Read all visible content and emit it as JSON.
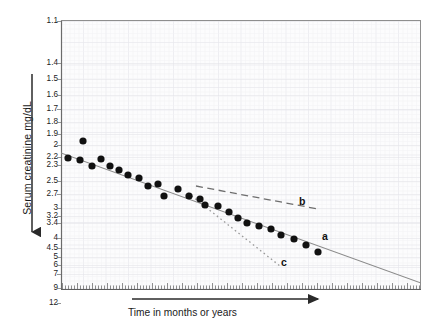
{
  "chart_data": {
    "type": "scatter",
    "title": "",
    "subtitle": "",
    "xlabel": "Time in months or years",
    "ylabel": "Serum creatinine mg/dL",
    "yscale": "reciprocal-log (inverted, 1/creatinine)",
    "y_tick_labels": [
      "1.1",
      "1.4",
      "1.5",
      "1.6",
      "1.7",
      "1.8",
      "1.9",
      "2",
      "2.2",
      "2.3",
      "2.5",
      "2.7",
      "3",
      "3.2",
      "3.4",
      "4",
      "4.5",
      "5",
      "6",
      "7",
      "9",
      "12"
    ],
    "y_tick_pixels": [
      21,
      63,
      79,
      95,
      109,
      122,
      134,
      145,
      157,
      165,
      181,
      194,
      208,
      216,
      223,
      238,
      248,
      257,
      265,
      274,
      288,
      303
    ],
    "ylim_labels": [
      "1.1",
      "12"
    ],
    "x_tick_style": "fine unlabeled graduations",
    "grid": true,
    "grid_style": "faint semi-log graph paper",
    "legend_position": "inline annotations",
    "points": [
      {
        "x": 68,
        "y": 158
      },
      {
        "x": 80,
        "y": 160
      },
      {
        "x": 83,
        "y": 141
      },
      {
        "x": 92,
        "y": 166
      },
      {
        "x": 101,
        "y": 159
      },
      {
        "x": 110,
        "y": 166
      },
      {
        "x": 119,
        "y": 170
      },
      {
        "x": 128,
        "y": 175
      },
      {
        "x": 139,
        "y": 178
      },
      {
        "x": 148,
        "y": 186
      },
      {
        "x": 158,
        "y": 184
      },
      {
        "x": 164,
        "y": 196
      },
      {
        "x": 178,
        "y": 189
      },
      {
        "x": 189,
        "y": 196
      },
      {
        "x": 200,
        "y": 199
      },
      {
        "x": 205,
        "y": 205
      },
      {
        "x": 218,
        "y": 206
      },
      {
        "x": 229,
        "y": 212
      },
      {
        "x": 238,
        "y": 218
      },
      {
        "x": 247,
        "y": 223
      },
      {
        "x": 259,
        "y": 226
      },
      {
        "x": 271,
        "y": 229
      },
      {
        "x": 281,
        "y": 235
      },
      {
        "x": 294,
        "y": 239
      },
      {
        "x": 306,
        "y": 245
      },
      {
        "x": 318,
        "y": 252
      }
    ],
    "series": [
      {
        "name": "a",
        "label": "a",
        "style": "solid",
        "description": "observed decline of 1/creatinine over time",
        "x1": 61,
        "y1": 153,
        "x2": 421,
        "y2": 283,
        "label_x": 322,
        "label_y": 230
      },
      {
        "name": "b",
        "label": "b",
        "style": "dashed",
        "description": "slowed progression after intervention",
        "x1": 196,
        "y1": 186,
        "x2": 318,
        "y2": 209,
        "label_x": 299,
        "label_y": 195
      },
      {
        "name": "c",
        "label": "c",
        "style": "dotted",
        "description": "accelerated progression",
        "x1": 188,
        "y1": 193,
        "x2": 280,
        "y2": 266,
        "label_x": 281,
        "label_y": 256
      }
    ],
    "axis_arrows": {
      "y_arrow": "downward arrow alongside y-axis label",
      "x_arrow": "rightward arrow above x-axis label"
    }
  },
  "colors": {
    "point": "#111111",
    "line_a": "#8a8a8a",
    "line_b": "#6e6e6e",
    "line_c": "#9a9a9a",
    "axis": "#6b6b6b",
    "grid": "#f1f1f3",
    "grid_major": "#e8e8ec",
    "plot_bg": "#fcfcfd",
    "text": "#1a1a1a"
  }
}
